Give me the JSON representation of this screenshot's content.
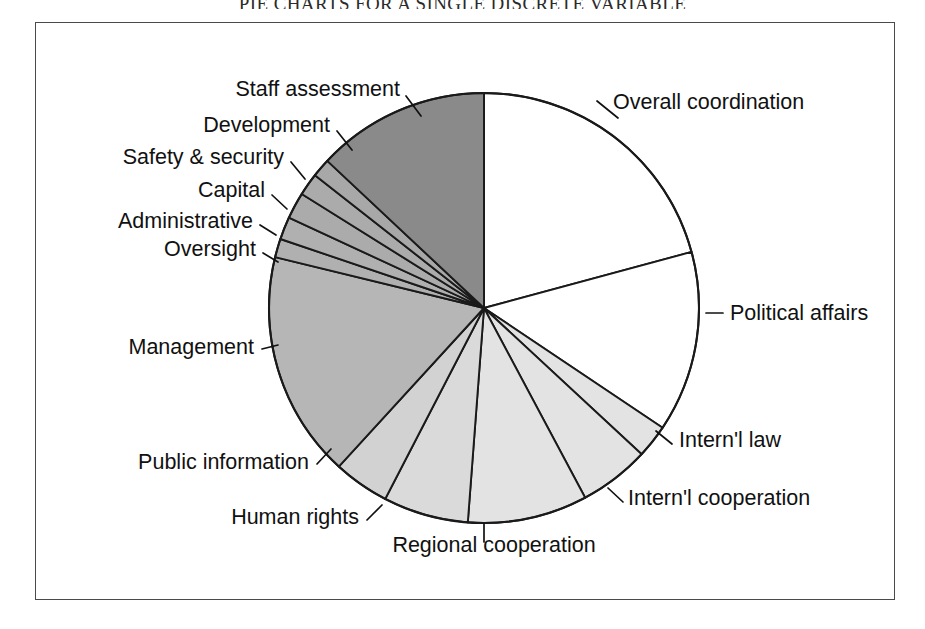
{
  "running_head": "PIE CHARTS FOR A SINGLE DISCRETE VARIABLE",
  "figure": {
    "frame_color": "#4a4a4a",
    "background": "#ffffff"
  },
  "chart_data": {
    "type": "pie",
    "title": "",
    "start_angle_deg": 0,
    "direction": "clockwise",
    "legend": "none",
    "labels_position": "outside-with-leader-lines",
    "categories": [
      "Overall coordination",
      "Political affairs",
      "Intern'l law",
      "Intern'l cooperation",
      "Regional cooperation",
      "Human rights",
      "Public information",
      "Management",
      "Oversight",
      "Administrative",
      "Capital",
      "Safety & security",
      "Development",
      "Staff assessment"
    ],
    "values": [
      20.8,
      13.6,
      2.5,
      5.3,
      9.0,
      6.4,
      4.2,
      17.0,
      1.4,
      1.7,
      2.0,
      1.7,
      1.4,
      13.0
    ],
    "colors": [
      "#ffffff",
      "#ffffff",
      "#e3e3e3",
      "#e3e3e3",
      "#e3e3e3",
      "#dadada",
      "#d2d2d2",
      "#b6b6b6",
      "#b0b0b0",
      "#b0b0b0",
      "#ababab",
      "#ababab",
      "#a8a8a8",
      "#8a8a8a"
    ],
    "slices": [
      {
        "label": "Overall coordination",
        "value": 20.8,
        "color": "#ffffff",
        "label_x": 612,
        "label_y": 108,
        "anchor": "start",
        "leader": "M 596 100 L 617 117"
      },
      {
        "label": "Political affairs",
        "value": 13.6,
        "color": "#ffffff",
        "label_x": 729,
        "label_y": 319,
        "anchor": "start",
        "leader": "M 705 312 L 722 312"
      },
      {
        "label": "Intern'l law",
        "value": 2.5,
        "color": "#e3e3e3",
        "label_x": 678,
        "label_y": 446,
        "anchor": "start",
        "leader": "M 655 430 L 671 443"
      },
      {
        "label": "Intern'l cooperation",
        "value": 5.3,
        "color": "#e3e3e3",
        "label_x": 627,
        "label_y": 504,
        "anchor": "start",
        "leader": "M 607 487 L 622 501"
      },
      {
        "label": "Regional cooperation",
        "value": 9.0,
        "color": "#e3e3e3",
        "label_x": 493,
        "label_y": 551,
        "anchor": "middle",
        "leader": "M 483 523 L 483 541"
      },
      {
        "label": "Human rights",
        "value": 6.4,
        "color": "#dadada",
        "label_x": 358,
        "label_y": 523,
        "anchor": "end",
        "leader": "M 381 504 L 366 519"
      },
      {
        "label": "Public information",
        "value": 4.2,
        "color": "#d2d2d2",
        "label_x": 308,
        "label_y": 468,
        "anchor": "end",
        "leader": "M 330 448 L 316 463"
      },
      {
        "label": "Management",
        "value": 17.0,
        "color": "#b6b6b6",
        "label_x": 253,
        "label_y": 353,
        "anchor": "end",
        "leader": "M 277 344 L 261 348"
      },
      {
        "label": "Oversight",
        "value": 1.4,
        "color": "#b0b0b0",
        "label_x": 255,
        "label_y": 255,
        "anchor": "end",
        "leader": "M 277 261 L 262 252"
      },
      {
        "label": "Administrative",
        "value": 1.7,
        "color": "#b0b0b0",
        "label_x": 252,
        "label_y": 227,
        "anchor": "end",
        "leader": "M 275 234 L 259 224"
      },
      {
        "label": "Capital",
        "value": 2.0,
        "color": "#ababab",
        "label_x": 264,
        "label_y": 196,
        "anchor": "end",
        "leader": "M 286 208 L 271 194"
      },
      {
        "label": "Safety & security",
        "value": 1.7,
        "color": "#ababab",
        "label_x": 283,
        "label_y": 163,
        "anchor": "end",
        "leader": "M 304 178 L 290 161"
      },
      {
        "label": "Development",
        "value": 1.4,
        "color": "#a8a8a8",
        "label_x": 329,
        "label_y": 131,
        "anchor": "end",
        "leader": "M 351 149 L 336 130"
      },
      {
        "label": "Staff assessment",
        "value": 13.0,
        "color": "#8a8a8a",
        "label_x": 399,
        "label_y": 95,
        "anchor": "end",
        "leader": "M 420 115 L 405 95"
      }
    ]
  },
  "geometry": {
    "center_x": 483,
    "center_y": 307,
    "radius": 215
  }
}
